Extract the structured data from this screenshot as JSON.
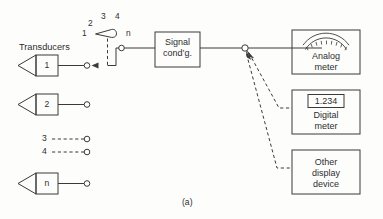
{
  "figure": {
    "caption": "(a)",
    "transducers_label": "Transducers"
  },
  "transducers": [
    {
      "id": "t1",
      "label": "1",
      "style": "solid",
      "has_arrow": true
    },
    {
      "id": "t2",
      "label": "2",
      "style": "solid",
      "has_arrow": false
    },
    {
      "id": "t3",
      "label": "3",
      "style": "dashed",
      "has_arrow": false
    },
    {
      "id": "t4",
      "label": "4",
      "style": "dashed",
      "has_arrow": false
    },
    {
      "id": "tn",
      "label": "n",
      "style": "solid",
      "has_arrow": false
    }
  ],
  "selector_switch": {
    "name": "rotary-selector-switch",
    "contacts": [
      "1",
      "2",
      "3",
      "4"
    ],
    "last_contact": "n",
    "selected": "1"
  },
  "signal_conditioner": {
    "line1": "Signal",
    "line2": "cond’g."
  },
  "displays": [
    {
      "id": "analog-meter",
      "line1": "Analog",
      "line2": "meter",
      "icon": "analog-gauge-icon",
      "reading": null
    },
    {
      "id": "digital-meter",
      "line1": "Digital",
      "line2": "meter",
      "icon": "digital-readout-icon",
      "reading": "1.234"
    },
    {
      "id": "other-display-device",
      "line1": "Other",
      "line2": "display",
      "line3": "device",
      "icon": null,
      "reading": null
    }
  ],
  "colors": {
    "ink": "#3a3a3a",
    "text": "#2e2e2e",
    "paper": "#fdfdfc"
  }
}
